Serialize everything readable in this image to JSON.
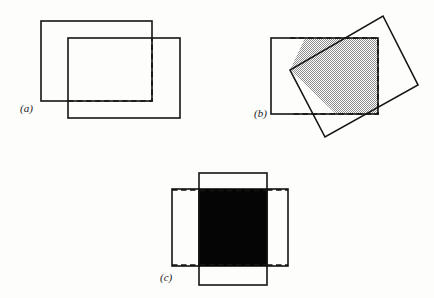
{
  "figure": {
    "width": 434,
    "height": 298,
    "background_color": "#fdfdfb",
    "line_color": "#151515",
    "hatch_color": "#9a9a9a",
    "black_fill_color": "#050505"
  },
  "panels": [
    {
      "id": "a",
      "label": "(a)",
      "label_x": 20,
      "label_y": 112,
      "description": "Two overlapping axis-aligned rectangles with dashed intersection outline",
      "shapes": {
        "rect_back": {
          "x": 41,
          "y": 21,
          "w": 111,
          "h": 80
        },
        "rect_front": {
          "x": 68,
          "y": 38,
          "w": 112,
          "h": 80
        },
        "intersection_dashed": {
          "x": 68,
          "y": 38,
          "w": 84,
          "h": 63
        }
      }
    },
    {
      "id": "b",
      "label": "(b)",
      "label_x": 254,
      "label_y": 117,
      "description": "Axis-aligned rectangle overlapped by a rotated rectangle; shaded intersection polygon with dashed bounding box",
      "shapes": {
        "rect_axis": {
          "x": 271,
          "y": 38,
          "w": 107,
          "h": 76
        },
        "rect_rotated_points": "383,16 418,85 325,137 290,70",
        "intersection_polygon_points": "305,38 378,38 378,114 336,114 290,70",
        "bounding_box_dashed": {
          "x": 290,
          "y": 38,
          "w": 88,
          "h": 76
        }
      }
    },
    {
      "id": "c",
      "label": "(c)",
      "label_x": 160,
      "label_y": 281,
      "description": "Tall rectangle crossed with wide rectangle; solid black intersection region bounded by dashed horizontal lines",
      "shapes": {
        "rect_tall": {
          "x": 199,
          "y": 173,
          "w": 68,
          "h": 112
        },
        "rect_wide": {
          "x": 172,
          "y": 189,
          "w": 116,
          "h": 77
        },
        "intersection_black": {
          "x": 199,
          "y": 189,
          "w": 68,
          "h": 77
        },
        "dashed_top_line": {
          "x1": 199,
          "y1": 190,
          "x2": 267,
          "y2": 190
        },
        "dashed_bottom_line": {
          "x1": 199,
          "y1": 265,
          "x2": 267,
          "y2": 265
        }
      }
    }
  ]
}
